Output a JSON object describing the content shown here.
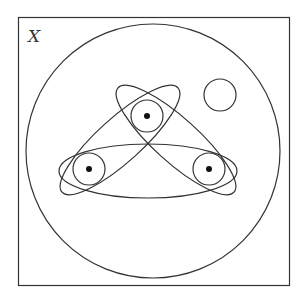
{
  "diagram": {
    "label": "X",
    "frame": {
      "x": 18.5,
      "y": 17.5,
      "width": 271,
      "height": 268
    },
    "universe_circle": {
      "cx": 153,
      "cy": 151,
      "r": 127
    },
    "points": [
      {
        "id": "top",
        "cx": 147,
        "cy": 116
      },
      {
        "id": "left",
        "cx": 89,
        "cy": 169
      },
      {
        "id": "right",
        "cx": 209,
        "cy": 169
      }
    ],
    "point_circles_r": 16,
    "empty_circle": {
      "cx": 220,
      "cy": 95,
      "r": 16
    },
    "ellipses": [
      {
        "id": "horizontal",
        "cx": 148,
        "cy": 171,
        "rx": 89,
        "ry": 27,
        "angle": 0
      },
      {
        "id": "top-right-diag",
        "cx": 176,
        "cy": 140,
        "rx": 78,
        "ry": 22,
        "angle": 42
      },
      {
        "id": "top-left-diag",
        "cx": 120,
        "cy": 140,
        "rx": 78,
        "ry": 22,
        "angle": -42
      }
    ],
    "stroke_color": "#333333"
  }
}
